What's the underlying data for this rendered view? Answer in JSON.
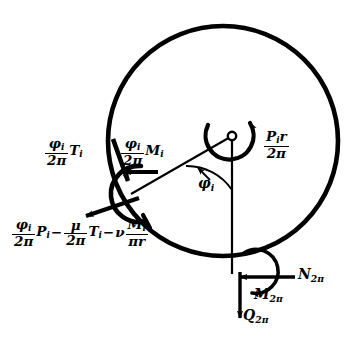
{
  "figure": {
    "type": "free-body-diagram",
    "background_color": "#ffffff",
    "stroke_color": "#000000"
  },
  "geometry": {
    "circle": {
      "cx": 223,
      "cy": 141,
      "r": 115
    },
    "hub": {
      "cx": 232,
      "cy": 136,
      "r": 4
    },
    "contact_point": {
      "x": 133,
      "y": 193
    },
    "bottom_point": {
      "x": 232,
      "y": 272
    }
  },
  "labels": {
    "phi_over_2pi_T": {
      "numerator": "φ",
      "numerator_sub": "i",
      "denominator": "2π",
      "symbol": "T",
      "symbol_sub": "i"
    },
    "phi_over_2pi_M": {
      "numerator": "φ",
      "numerator_sub": "i",
      "denominator": "2π",
      "symbol": "M",
      "symbol_sub": "i"
    },
    "resultant_formula": {
      "f1_num": "φ",
      "f1_num_sub": "i",
      "f1_den": "2π",
      "f1_sym": "P",
      "f1_sym_sub": "i",
      "op1": "−",
      "f2_num": "μ",
      "f2_den": "2π",
      "f2_sym": "T",
      "f2_sym_sub": "i",
      "op2": "−",
      "nu": "ν",
      "f3_num": "M",
      "f3_num_sub": "i",
      "f3_den": "πr"
    },
    "central_moment": {
      "num_sym": "P",
      "num_sub": "i",
      "num_r": "r",
      "den": "2π"
    },
    "angle": {
      "symbol": "φ",
      "sub": "i"
    },
    "normal_force": {
      "symbol": "N",
      "sub": "2π"
    },
    "moment": {
      "symbol": "M",
      "sub": "2π"
    },
    "shear_force": {
      "symbol": "Q",
      "sub": "2π"
    }
  }
}
